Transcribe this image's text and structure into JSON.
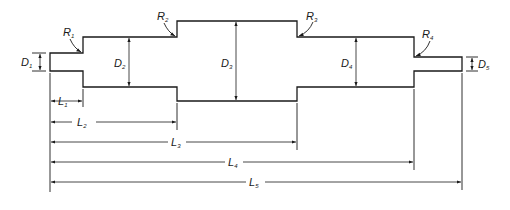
{
  "figure": {
    "line_color": "#1a1a1a",
    "background": "#ffffff"
  },
  "labels": {
    "diameters": [
      {
        "id": "D1",
        "main": "D",
        "sub": "1"
      },
      {
        "id": "D2",
        "main": "D",
        "sub": "2"
      },
      {
        "id": "D3",
        "main": "D",
        "sub": "3"
      },
      {
        "id": "D4",
        "main": "D",
        "sub": "4"
      },
      {
        "id": "D5",
        "main": "D",
        "sub": "5"
      }
    ],
    "radii": [
      {
        "id": "R1",
        "main": "R",
        "sub": "1"
      },
      {
        "id": "R2",
        "main": "R",
        "sub": "2"
      },
      {
        "id": "R3",
        "main": "R",
        "sub": "3"
      },
      {
        "id": "R4",
        "main": "R",
        "sub": "4"
      }
    ],
    "lengths": [
      {
        "id": "L1",
        "main": "L",
        "sub": "1"
      },
      {
        "id": "L2",
        "main": "L",
        "sub": "2"
      },
      {
        "id": "L3",
        "main": "L",
        "sub": "3"
      },
      {
        "id": "L4",
        "main": "L",
        "sub": "4"
      },
      {
        "id": "L5",
        "main": "L",
        "sub": "5"
      }
    ]
  }
}
